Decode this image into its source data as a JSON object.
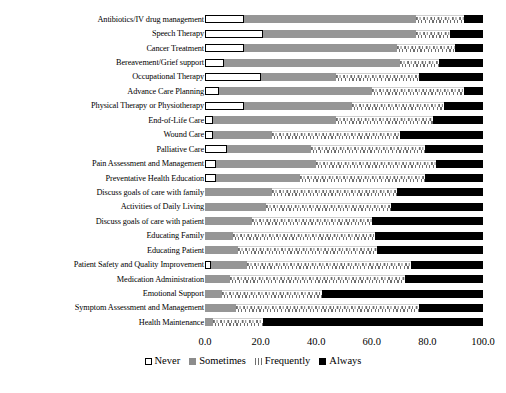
{
  "chart_data": {
    "type": "bar",
    "orientation": "horizontal",
    "stacked": true,
    "stack_mode": "percent",
    "title": "",
    "xlabel": "",
    "ylabel": "",
    "xlim": [
      0,
      100
    ],
    "xticks": [
      "0.0",
      "20.0",
      "40.0",
      "60.0",
      "80.0",
      "100.0"
    ],
    "xtick_values": [
      0,
      20,
      40,
      60,
      80,
      100
    ],
    "grid": false,
    "legend_position": "bottom-center",
    "legend": [
      "Never",
      "Sometimes",
      "Frequently",
      "Always"
    ],
    "colors": {
      "Never": "#ffffff",
      "Sometimes": "#969696",
      "Frequently": "#ffffff",
      "Always": "#000000"
    },
    "categories": [
      "Antibiotics/IV drug management",
      "Speech Therapy",
      "Cancer Treatment",
      "Bereavement/Grief support",
      "Occupational Therapy",
      "Advance Care Planning",
      "Physical Therapy or Physiotherapy",
      "End-of-Life Care",
      "Wound Care",
      "Palliative Care",
      "Pain Assessment and Management",
      "Preventative Health Education",
      "Discuss goals of care with family",
      "Activities of Daily Living",
      "Discuss goals of care with patient",
      "Educating Family",
      "Educating Patient",
      "Patient Safety and Quality Improvement",
      "Medication Administration",
      "Emotional Support",
      "Symptom Assessment and Management",
      "Health Maintenance"
    ],
    "series": [
      {
        "name": "Never",
        "values": [
          14,
          21,
          14,
          7,
          20,
          5,
          14,
          3,
          3,
          8,
          4,
          4,
          0,
          0,
          0,
          0,
          0,
          2,
          0,
          0,
          0,
          0
        ]
      },
      {
        "name": "Sometimes",
        "values": [
          62,
          55,
          55,
          63,
          27,
          55,
          39,
          44,
          21,
          30,
          36,
          30,
          24,
          22,
          17,
          10,
          12,
          13,
          9,
          6,
          11,
          3
        ]
      },
      {
        "name": "Frequently",
        "values": [
          17,
          12,
          21,
          14,
          30,
          33,
          33,
          35,
          46,
          41,
          43,
          45,
          45,
          45,
          43,
          51,
          50,
          59,
          63,
          36,
          66,
          18
        ]
      },
      {
        "name": "Always",
        "values": [
          7,
          12,
          10,
          16,
          23,
          7,
          14,
          18,
          30,
          21,
          17,
          21,
          31,
          33,
          40,
          39,
          38,
          26,
          28,
          58,
          23,
          79
        ]
      }
    ]
  }
}
